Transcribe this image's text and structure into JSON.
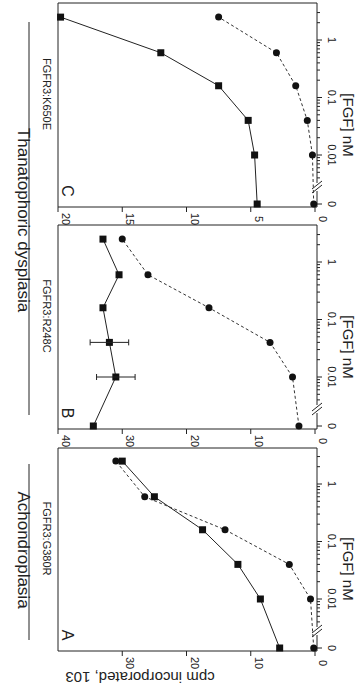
{
  "figure": {
    "group_titles": [
      {
        "label": "Achondroplasia",
        "panels": [
          "A"
        ]
      },
      {
        "label": "Thanatophoric dysplasia",
        "panels": [
          "B",
          "C"
        ]
      }
    ],
    "y_axis_label": "cpm incorporated, 10³",
    "y_axis_label_raw": "cpm incorporated, 103",
    "x_axis_label": "[FGF] nM",
    "orientation": "rotated 90° clockwise"
  },
  "chart_data": [
    {
      "type": "line",
      "panel": "A",
      "title": "FGFR3:G380R",
      "group": "Achondroplasia",
      "xlabel": "[FGF] nM",
      "ylabel": "cpm incorporated, 10³",
      "x_scale": "log with break at 0",
      "x_tick_labels": [
        "0",
        "0.01",
        "0.1",
        "1"
      ],
      "y_tick_labels": [
        "0",
        "10",
        "20",
        "30"
      ],
      "ylim": [
        0,
        35
      ],
      "x": [
        0,
        0.01,
        0.04,
        0.16,
        0.6,
        2.5
      ],
      "series": [
        {
          "name": "squares (solid line)",
          "marker": "square",
          "line": "solid",
          "values": [
            5.5,
            8.5,
            12,
            17.5,
            25,
            30
          ]
        },
        {
          "name": "circles (dashed line)",
          "marker": "circle",
          "line": "dashed",
          "values": [
            0.2,
            0.7,
            4,
            14,
            26.5,
            31
          ]
        }
      ],
      "grid": false
    },
    {
      "type": "line",
      "panel": "B",
      "title": "FGFR3:R248C",
      "group": "Thanatophoric dysplasia",
      "xlabel": "[FGF] nM",
      "ylabel": "cpm incorporated, 10³",
      "x_scale": "log with break at 0",
      "x_tick_labels": [
        "0",
        "0.01",
        "0.1",
        "1"
      ],
      "y_tick_labels": [
        "0",
        "10",
        "20",
        "30",
        "40"
      ],
      "ylim": [
        0,
        40
      ],
      "x": [
        0,
        0.01,
        0.04,
        0.16,
        0.6,
        2.5
      ],
      "series": [
        {
          "name": "squares (solid line)",
          "marker": "square",
          "line": "solid",
          "values": [
            34.5,
            31,
            32,
            33,
            30.5,
            33
          ]
        },
        {
          "name": "circles (dashed line)",
          "marker": "circle",
          "line": "dashed",
          "values": [
            2.5,
            3.5,
            7,
            16.5,
            26,
            30
          ]
        }
      ],
      "grid": false
    },
    {
      "type": "line",
      "panel": "C",
      "title": "FGFR3:K650E",
      "group": "Thanatophoric dysplasia",
      "xlabel": "[FGF] nM",
      "ylabel": "cpm incorporated, 10³",
      "x_scale": "log with break at 0",
      "x_tick_labels": [
        "0",
        "0.01",
        "0.1",
        "1"
      ],
      "y_tick_labels": [
        "0",
        "5",
        "10",
        "15",
        "20"
      ],
      "ylim": [
        0,
        20
      ],
      "x": [
        0,
        0.01,
        0.04,
        0.16,
        0.6,
        2.5
      ],
      "series": [
        {
          "name": "squares (solid line)",
          "marker": "square",
          "line": "solid",
          "values": [
            4.5,
            4.7,
            5.2,
            7.5,
            12,
            19.8
          ]
        },
        {
          "name": "circles (dashed line)",
          "marker": "circle",
          "line": "dashed",
          "values": [
            0.1,
            0.2,
            0.6,
            1.5,
            3,
            7.5
          ]
        }
      ],
      "grid": false
    }
  ]
}
